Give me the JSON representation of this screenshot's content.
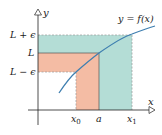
{
  "diagram": {
    "type": "epsilon-delta limit illustration",
    "curve_label": "y = f(x)",
    "axes": {
      "x_label": "x",
      "y_label": "y"
    },
    "y_ticks": [
      {
        "label": "L + ϵ",
        "y": 35
      },
      {
        "label": "L",
        "y": 53
      },
      {
        "label": "L − ϵ",
        "y": 72
      }
    ],
    "x_ticks": [
      {
        "label": "x",
        "sub": "0",
        "x": 76
      },
      {
        "label": "a",
        "sub": "",
        "x": 99
      },
      {
        "label": "x",
        "sub": "1",
        "x": 132
      }
    ],
    "colors": {
      "teal_region": "#b4ddd6",
      "salmon_region": "#f4bca4",
      "curve": "#3f7fb0",
      "axis": "#222222",
      "guide": "#777777"
    }
  }
}
